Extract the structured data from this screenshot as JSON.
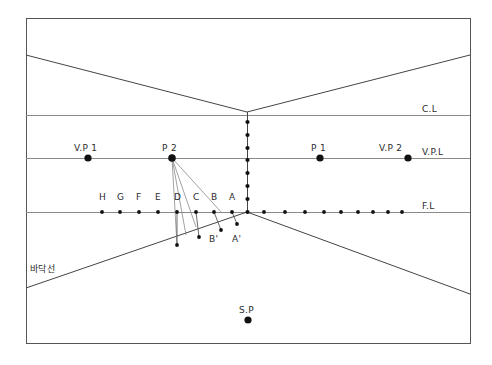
{
  "diagram": {
    "frame": {
      "x": 26,
      "y": 18,
      "width": 444,
      "height": 325,
      "stroke": "#555555"
    },
    "colors": {
      "line": "#444444",
      "guide": "#8a8a8a",
      "dot": "#111111",
      "text": "#2b2b2b",
      "background": "#ffffff"
    },
    "horizontal_lines": [
      {
        "name": "C.L",
        "label": "C.L",
        "y": 115,
        "label_x": 422,
        "label_y": 104
      },
      {
        "name": "V.P.L",
        "label": "V.P.L",
        "y": 158,
        "label_x": 422,
        "label_y": 147
      },
      {
        "name": "F.L",
        "label": "F.L",
        "y": 212,
        "label_x": 422,
        "label_y": 201
      }
    ],
    "vertical_line": {
      "x": 247,
      "y_top": 112,
      "y_bottom": 212
    },
    "vertical_dots_y": [
      122,
      135,
      148,
      160,
      173,
      186,
      199,
      212
    ],
    "ceiling_lines": [
      {
        "x1": 26,
        "y1": 55,
        "x2": 247,
        "y2": 112
      },
      {
        "x1": 247,
        "y1": 112,
        "x2": 470,
        "y2": 55
      }
    ],
    "floor_lines": [
      {
        "x1": 26,
        "y1": 288,
        "x2": 247,
        "y2": 212
      },
      {
        "x1": 247,
        "y1": 212,
        "x2": 470,
        "y2": 294
      }
    ],
    "vpl_points": [
      {
        "label": "V.P 1",
        "x": 88,
        "y": 158,
        "label_x": 74,
        "label_y": 143,
        "radius": 3.6
      },
      {
        "label": "P 2",
        "x": 172,
        "y": 158,
        "label_x": 162,
        "label_y": 143,
        "radius": 3.8
      },
      {
        "label": "P 1",
        "x": 320,
        "y": 158,
        "label_x": 311,
        "label_y": 143,
        "radius": 3.6
      },
      {
        "label": "V.P 2",
        "x": 408,
        "y": 158,
        "label_x": 379,
        "label_y": 143,
        "radius": 3.6
      }
    ],
    "station_point": {
      "label": "S.P",
      "x": 248,
      "y": 320,
      "label_x": 239,
      "label_y": 305,
      "radius": 3.6
    },
    "fl_left_labels": [
      "H",
      "G",
      "F",
      "E",
      "D",
      "C",
      "B",
      "A"
    ],
    "fl_left_dots_x": [
      102,
      120,
      139,
      158,
      177,
      196,
      214,
      232
    ],
    "fl_left_label_y": 202,
    "fl_right_dots_x": [
      264,
      285,
      305,
      324,
      341,
      358,
      373,
      388,
      402
    ],
    "fl_dot_radius": 1.9,
    "prime_points": [
      {
        "label": "A'",
        "x": 237,
        "y": 224,
        "label_x": 232,
        "label_y": 234
      },
      {
        "label": "B'",
        "x": 221,
        "y": 230,
        "label_x": 209,
        "label_y": 234
      },
      {
        "label": "C'",
        "x": 199,
        "y": 237,
        "label_x": null,
        "label_y": null
      },
      {
        "label": "D'",
        "x": 177,
        "y": 245,
        "label_x": null,
        "label_y": null
      }
    ],
    "p2_rays": [
      {
        "from_x": 172,
        "from_y": 158,
        "to_x": 177,
        "to_y": 245
      },
      {
        "from_x": 172,
        "from_y": 158,
        "to_x": 186,
        "to_y": 235
      },
      {
        "from_x": 172,
        "from_y": 158,
        "to_x": 196,
        "to_y": 227
      },
      {
        "from_x": 172,
        "from_y": 158,
        "to_x": 222,
        "to_y": 213
      }
    ],
    "drop_lines": [
      {
        "x1": 177,
        "y1": 212,
        "x2": 177,
        "y2": 245
      },
      {
        "x1": 196,
        "y1": 212,
        "x2": 199,
        "y2": 237
      },
      {
        "x1": 214,
        "y1": 212,
        "x2": 221,
        "y2": 230
      },
      {
        "x1": 232,
        "y1": 212,
        "x2": 237,
        "y2": 224
      }
    ],
    "korean_note": {
      "text": "바닥선",
      "x": 30,
      "y": 262
    }
  }
}
